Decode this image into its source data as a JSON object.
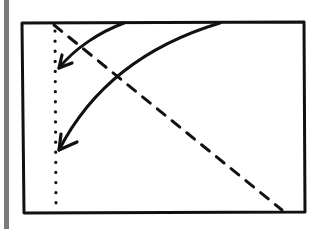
{
  "diagram": {
    "type": "hand-drawn sketch",
    "elements": [
      {
        "id": "frame",
        "shape": "rectangle",
        "style": "solid"
      },
      {
        "id": "vertical-line",
        "shape": "line",
        "style": "dotted",
        "orientation": "vertical",
        "position": "near left edge"
      },
      {
        "id": "diagonal-line",
        "shape": "line",
        "style": "dashed",
        "from": "top-left",
        "to": "bottom-right"
      },
      {
        "id": "arrow-short",
        "shape": "curved arrow",
        "from": "top edge",
        "to": "dotted line (upper)"
      },
      {
        "id": "arrow-long",
        "shape": "curved arrow",
        "from": "top edge",
        "to": "dotted line (lower)"
      }
    ],
    "colors": {
      "ink": "#111111",
      "side_bar": "#7a7a7a",
      "background": "#ffffff"
    }
  }
}
